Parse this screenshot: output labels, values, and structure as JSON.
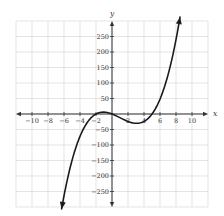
{
  "chart_data": {
    "type": "line",
    "title": "",
    "xlabel": "x",
    "ylabel": "y",
    "xlim": [
      -12,
      12
    ],
    "ylim": [
      -300,
      300
    ],
    "grid": true,
    "x_grid_step": 2,
    "y_grid_step": 50,
    "x_tick_labels": [
      "-10",
      "-8",
      "-6",
      "-4",
      "-2",
      "2",
      "4",
      "6",
      "8",
      "10"
    ],
    "x_ticks": [
      -10,
      -8,
      -6,
      -4,
      -2,
      2,
      4,
      6,
      8,
      10
    ],
    "y_tick_labels": [
      "250",
      "200",
      "150",
      "100",
      "50",
      "-50",
      "-100",
      "-150",
      "-200",
      "-250"
    ],
    "y_ticks": [
      250,
      200,
      150,
      100,
      50,
      -50,
      -100,
      -150,
      -200,
      -250
    ],
    "series": [
      {
        "name": "f(x) = x(x+2)(x-5)",
        "description": "cubic with roots at -2, 0, 5; local max ~6 near x=-1, local min ~-30 near x=3; arrows on both ends",
        "x": [
          -6.3,
          -6,
          -5,
          -4,
          -3,
          -2,
          -1,
          0,
          1,
          2,
          3,
          4,
          5,
          6,
          7,
          8,
          8.5
        ],
        "values": [
          -306,
          -264,
          -150,
          -72,
          -24,
          0,
          6,
          0,
          -12,
          -24,
          -30,
          -24,
          0,
          48,
          126,
          240,
          312
        ]
      }
    ],
    "legend": null
  },
  "colors": {
    "curve": "#1a1a1a",
    "axis": "#333333",
    "grid": "#d9d9d9",
    "background": "#ffffff"
  }
}
